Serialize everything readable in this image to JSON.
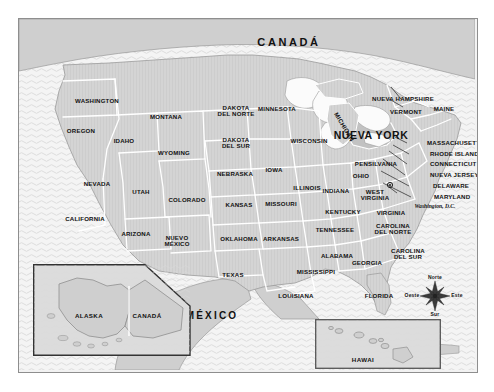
{
  "map": {
    "title_canada": "CANADÁ",
    "title_mexico": "MÉXICO",
    "highlight_state": "NUEVA YORK",
    "capital_label": "Washington, D.C.",
    "colors": {
      "land": "#d4d4d4",
      "ocean": "#f4f4f4",
      "lake": "#fbfbfb",
      "border": "#ffffff",
      "coastline": "#9a9a9a",
      "highlight": "#c2c2c2",
      "text": "#111111",
      "frame": "#8e8e8e",
      "inset_border": "#4a4a4a"
    },
    "states": [
      {
        "name": "WASHINGTON",
        "x": 78,
        "y": 82,
        "size": "st"
      },
      {
        "name": "OREGON",
        "x": 62,
        "y": 112,
        "size": "st"
      },
      {
        "name": "IDAHO",
        "x": 105,
        "y": 122,
        "size": "st"
      },
      {
        "name": "MONTANA",
        "x": 147,
        "y": 98,
        "size": "st"
      },
      {
        "name": "WYOMING",
        "x": 155,
        "y": 134,
        "size": "st"
      },
      {
        "name": "NEVADA",
        "x": 78,
        "y": 165,
        "size": "st"
      },
      {
        "name": "UTAH",
        "x": 122,
        "y": 173,
        "size": "st"
      },
      {
        "name": "CALIFORNIA",
        "x": 66,
        "y": 200,
        "size": "st"
      },
      {
        "name": "ARIZONA",
        "x": 117,
        "y": 215,
        "size": "st"
      },
      {
        "name": "COLORADO",
        "x": 168,
        "y": 181,
        "size": "st"
      },
      {
        "name": "NUEVO\nMÉXICO",
        "x": 158,
        "y": 222,
        "size": "st"
      },
      {
        "name": "DAKOTA\nDEL NORTE",
        "x": 217,
        "y": 92,
        "size": "st"
      },
      {
        "name": "DAKOTA\nDEL SUR",
        "x": 217,
        "y": 124,
        "size": "st"
      },
      {
        "name": "NEBRASKA",
        "x": 216,
        "y": 155,
        "size": "st"
      },
      {
        "name": "KANSAS",
        "x": 220,
        "y": 186,
        "size": "st"
      },
      {
        "name": "OKLAHOMA",
        "x": 220,
        "y": 220,
        "size": "st"
      },
      {
        "name": "TEXAS",
        "x": 214,
        "y": 256,
        "size": "st"
      },
      {
        "name": "MINNESOTA",
        "x": 258,
        "y": 90,
        "size": "st"
      },
      {
        "name": "IOWA",
        "x": 255,
        "y": 151,
        "size": "st"
      },
      {
        "name": "MISSOURI",
        "x": 262,
        "y": 185,
        "size": "st"
      },
      {
        "name": "ARKANSAS",
        "x": 262,
        "y": 220,
        "size": "st"
      },
      {
        "name": "LOUISIANA",
        "x": 277,
        "y": 277,
        "size": "st"
      },
      {
        "name": "WISCONSIN",
        "x": 290,
        "y": 122,
        "size": "st"
      },
      {
        "name": "ILLINOIS",
        "x": 288,
        "y": 169,
        "size": "st"
      },
      {
        "name": "INDIANA",
        "x": 317,
        "y": 172,
        "size": "st"
      },
      {
        "name": "MICHIGAN",
        "x": 325,
        "y": 108,
        "size": "rot-mi"
      },
      {
        "name": "OHIO",
        "x": 342,
        "y": 157,
        "size": "st"
      },
      {
        "name": "KENTUCKY",
        "x": 324,
        "y": 193,
        "size": "st"
      },
      {
        "name": "TENNESSEE",
        "x": 316,
        "y": 211,
        "size": "st"
      },
      {
        "name": "MISSISSIPPI",
        "x": 297,
        "y": 253,
        "size": "st"
      },
      {
        "name": "ALABAMA",
        "x": 318,
        "y": 237,
        "size": "st"
      },
      {
        "name": "GEORGIA",
        "x": 348,
        "y": 244,
        "size": "st"
      },
      {
        "name": "FLORIDA",
        "x": 360,
        "y": 277,
        "size": "st"
      },
      {
        "name": "WEST\nVIRGINIA",
        "x": 356,
        "y": 176,
        "size": "st"
      },
      {
        "name": "VIRGINIA",
        "x": 372,
        "y": 194,
        "size": "st"
      },
      {
        "name": "CAROLINA\nDEL NORTE",
        "x": 374,
        "y": 210,
        "size": "st"
      },
      {
        "name": "CAROLINA\nDEL SUR",
        "x": 389,
        "y": 235,
        "size": "st"
      },
      {
        "name": "PENSILVANIA",
        "x": 357,
        "y": 145,
        "size": "st"
      },
      {
        "name": "VERMONT",
        "x": 387,
        "y": 93,
        "size": "st"
      },
      {
        "name": "NUEVA HAMPSHIRE",
        "x": 384,
        "y": 80,
        "size": "st"
      },
      {
        "name": "MAINE",
        "x": 425,
        "y": 90,
        "size": "st"
      }
    ],
    "callout_states": [
      {
        "name": "MASSACHUSETTS",
        "x": 408,
        "y": 124
      },
      {
        "name": "RHODE ISLAND",
        "x": 411,
        "y": 135
      },
      {
        "name": "CONNECTICUT",
        "x": 411,
        "y": 145
      },
      {
        "name": "NUEVA JERSEY",
        "x": 411,
        "y": 156
      },
      {
        "name": "DELAWARE",
        "x": 414,
        "y": 167
      },
      {
        "name": "MARYLAND",
        "x": 415,
        "y": 178
      }
    ],
    "insets": [
      {
        "id": "alaska",
        "labels": [
          {
            "name": "ALASKA",
            "x": 56,
            "y": 52
          },
          {
            "name": "CANADÁ",
            "x": 114,
            "y": 52
          }
        ]
      },
      {
        "id": "hawaii",
        "labels": [
          {
            "name": "HAWAI",
            "x": 48,
            "y": 41
          }
        ]
      }
    ],
    "compass": {
      "north": "Norte",
      "south": "Sur",
      "east": "Este",
      "west": "Oeste",
      "cx": 434,
      "cy": 295
    }
  }
}
